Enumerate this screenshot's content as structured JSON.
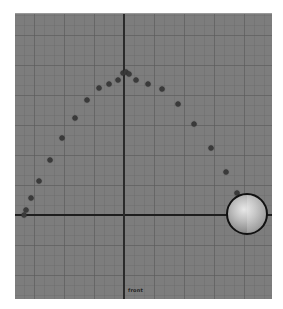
{
  "viewport": {
    "camera_label": "front",
    "background_color": "#7d7d7d",
    "grid_color": "#5a5a5a",
    "axis_color": "#1e1e1e",
    "origin_px": [
      124,
      214
    ]
  },
  "trajectory": {
    "dot_color": "#3a3a3a",
    "points_px": [
      [
        24,
        214
      ],
      [
        26,
        209
      ],
      [
        31,
        197
      ],
      [
        39,
        180
      ],
      [
        50,
        159
      ],
      [
        62,
        137
      ],
      [
        75,
        117
      ],
      [
        87,
        99
      ],
      [
        99,
        87
      ],
      [
        109,
        83
      ],
      [
        118,
        79
      ],
      [
        123,
        72
      ],
      [
        126,
        71
      ],
      [
        129,
        73
      ],
      [
        136,
        79
      ],
      [
        148,
        83
      ],
      [
        162,
        88
      ],
      [
        178,
        103
      ],
      [
        194,
        123
      ],
      [
        211,
        147
      ],
      [
        226,
        171
      ],
      [
        237,
        192
      ]
    ]
  },
  "sphere": {
    "center_px": [
      247,
      213
    ],
    "radius_px": 21
  }
}
